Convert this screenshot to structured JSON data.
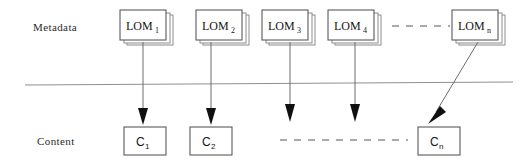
{
  "diagram": {
    "background_color": "#ffffff",
    "line_color": "#6d6d6d",
    "separator_color": "#8f8f8f",
    "arrow_color": "#101010",
    "rows": [
      {
        "id": "metadata",
        "label": "Metadata"
      },
      {
        "id": "content",
        "label": "Content"
      }
    ],
    "separator": {
      "visible": true
    },
    "metadata_nodes": [
      {
        "id": "lom1",
        "base": "LOM",
        "sub": "1",
        "x": 120,
        "y": 10,
        "w": 46,
        "h": 30,
        "shape": "stacked-document"
      },
      {
        "id": "lom2",
        "base": "LOM",
        "sub": "2",
        "x": 196,
        "y": 10,
        "w": 46,
        "h": 30,
        "shape": "stacked-document"
      },
      {
        "id": "lom3",
        "base": "LOM",
        "sub": "3",
        "x": 262,
        "y": 10,
        "w": 46,
        "h": 30,
        "shape": "stacked-document"
      },
      {
        "id": "lom4",
        "base": "LOM",
        "sub": "4",
        "x": 328,
        "y": 10,
        "w": 46,
        "h": 30,
        "shape": "stacked-document"
      },
      {
        "id": "lomn",
        "base": "LOM",
        "sub": "n",
        "x": 452,
        "y": 10,
        "w": 46,
        "h": 30,
        "shape": "stacked-document"
      }
    ],
    "metadata_ellipsis": {
      "id": "metadata-ellipsis",
      "x1": 392,
      "x2": 450,
      "y": 26,
      "style": "dashed"
    },
    "content_nodes": [
      {
        "id": "c1",
        "base": "C",
        "sub": "1",
        "x": 124,
        "y": 127,
        "w": 42,
        "h": 28,
        "shape": "rectangle"
      },
      {
        "id": "c2",
        "base": "C",
        "sub": "2",
        "x": 190,
        "y": 127,
        "w": 42,
        "h": 28,
        "shape": "rectangle"
      },
      {
        "id": "cn",
        "base": "C",
        "sub": "n",
        "x": 418,
        "y": 127,
        "w": 42,
        "h": 28,
        "shape": "rectangle"
      }
    ],
    "content_ellipsis": {
      "id": "content-ellipsis",
      "x1": 280,
      "x2": 408,
      "y": 140,
      "style": "dashed"
    },
    "connectors": [
      {
        "id": "lom1-to-c1",
        "from": "lom1",
        "to": "c1",
        "type": "vertical-arrow",
        "x1": 143,
        "y1": 42,
        "x2": 143,
        "y2": 125
      },
      {
        "id": "lom2-to-c2",
        "from": "lom2",
        "to": "c2",
        "type": "vertical-arrow",
        "x1": 211,
        "y1": 42,
        "x2": 211,
        "y2": 125
      },
      {
        "id": "lom3-to-ellipsis",
        "from": "lom3",
        "to": "content-ellipsis",
        "type": "vertical-arrow",
        "x1": 290,
        "y1": 42,
        "x2": 290,
        "y2": 122
      },
      {
        "id": "lom4-to-ellipsis",
        "from": "lom4",
        "to": "content-ellipsis",
        "type": "vertical-arrow",
        "x1": 355,
        "y1": 42,
        "x2": 355,
        "y2": 122
      },
      {
        "id": "lomn-to-cn",
        "from": "lomn",
        "to": "cn",
        "type": "diagonal-arrow",
        "x1": 478,
        "y1": 42,
        "x2": 428,
        "y2": 124
      }
    ]
  }
}
